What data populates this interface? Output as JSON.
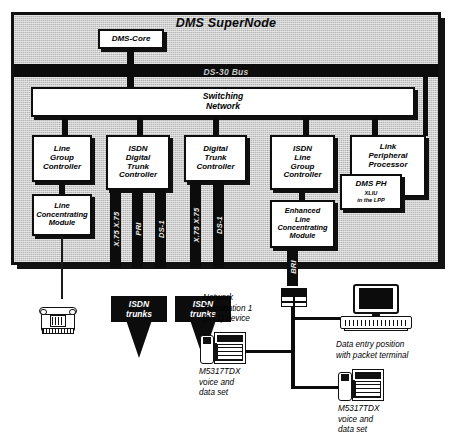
{
  "diagram": {
    "title": "DMS SuperNode",
    "bus_label": "DS-30 Bus",
    "core_label": "DMS-Core",
    "switching_network_label": "Switching\nNetwork"
  },
  "peripherals": [
    {
      "id": "lgc",
      "label": "Line\nGroup\nController"
    },
    {
      "id": "lcm",
      "label": "Line\nConcentrating\nModule"
    },
    {
      "id": "isdn-dtc",
      "label": "ISDN\nDigital\nTrunk\nController"
    },
    {
      "id": "dtc",
      "label": "Digital\nTrunk\nController"
    },
    {
      "id": "isdn-lgc",
      "label": "ISDN\nLine\nGroup\nController"
    },
    {
      "id": "elcm",
      "label": "Enhanced\nLine\nConcentrating\nModule"
    },
    {
      "id": "lpp",
      "label": "Link\nPeripheral\nProcessor"
    }
  ],
  "dms_ph": {
    "title": "DMS PH",
    "subtitle": "XLIU\nin the LPP"
  },
  "interface_labels": {
    "isdn_dtc": [
      "X.75 X.75",
      "PRI",
      "DS-1"
    ],
    "dtc": [
      "X.75 X.75",
      "DS-1"
    ],
    "bri": "BRI"
  },
  "trunks": [
    {
      "id": "trunk-1",
      "label": "ISDN\ntrunks"
    },
    {
      "id": "trunk-2",
      "label": "ISDN\ntrunks"
    }
  ],
  "endpoints": [
    {
      "id": "nt1",
      "caption": "Network\nTermination 1\n(NT1) device"
    },
    {
      "id": "terminal",
      "caption": "Data entry position\nwith packet terminal"
    },
    {
      "id": "vdset-1",
      "caption": "M5317TDX\nvoice and\ndata set"
    },
    {
      "id": "vdset-2",
      "caption": "M5317TDX\nvoice and\ndata set"
    }
  ],
  "colors": {
    "frame_fill": "#b4b4b4",
    "ink": "#0c0c0c",
    "box_fill": "#ffffff",
    "bus_text": "#c9c9c9"
  }
}
